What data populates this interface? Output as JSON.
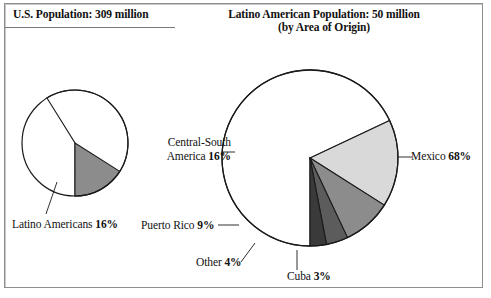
{
  "figure": {
    "title_left": "U.S. Population: 309 million",
    "title_right_line1": "Latino American Population: 50 million",
    "title_right_line2": "(by Area of Origin)"
  },
  "labels": {
    "latino_americans": "Latino Americans ",
    "latino_americans_pct": "16%",
    "central_south_america_l1": "Central-South",
    "central_south_america_l2": "America ",
    "central_south_america_pct": "16%",
    "puerto_rico": "Puerto Rico ",
    "puerto_rico_pct": "9%",
    "other": "Other ",
    "other_pct": "4%",
    "cuba": "Cuba ",
    "cuba_pct": "3%",
    "mexico": "Mexico ",
    "mexico_pct": "68%"
  },
  "colors": {
    "outline": "#1a1a1a",
    "frame": "#8d8d8d",
    "white_slice": "#ffffff",
    "light_grey": "#d9d9d9",
    "mid_grey": "#8c8c8c",
    "dark_grey": "#5c5c5c",
    "darkest_grey": "#3a3a3a",
    "leader": "#1a1a1a",
    "text": "#111111"
  },
  "chart_data": [
    {
      "type": "pie",
      "title": "U.S. Population: 309 million",
      "center": [
        75,
        143
      ],
      "radius": 53,
      "start_angle_deg": 180,
      "direction": "counterclockwise",
      "categories": [
        "Latino Americans",
        "Other U.S. Population"
      ],
      "values": [
        16,
        84
      ],
      "value_unit": "percent",
      "slice_colors": [
        "#8c8c8c",
        "#ffffff"
      ],
      "labeled_slices": [
        "Latino Americans 16%"
      ],
      "legend": "none",
      "grid": false
    },
    {
      "type": "pie",
      "title": "Latino American Population: 50 million (by Area of Origin)",
      "center": [
        310,
        158
      ],
      "radius": 88,
      "start_angle_deg": 180,
      "direction": "counterclockwise",
      "categories": [
        "Cuba",
        "Other",
        "Puerto Rico",
        "Central-South America",
        "Mexico"
      ],
      "values": [
        3,
        4,
        9,
        16,
        68
      ],
      "value_unit": "percent",
      "slice_colors": [
        "#3a3a3a",
        "#5c5c5c",
        "#8c8c8c",
        "#d9d9d9",
        "#ffffff"
      ],
      "labeled_slices": [
        "Cuba 3%",
        "Other 4%",
        "Puerto Rico 9%",
        "Central-South America 16%",
        "Mexico 68%"
      ],
      "legend": "none",
      "grid": false
    }
  ]
}
